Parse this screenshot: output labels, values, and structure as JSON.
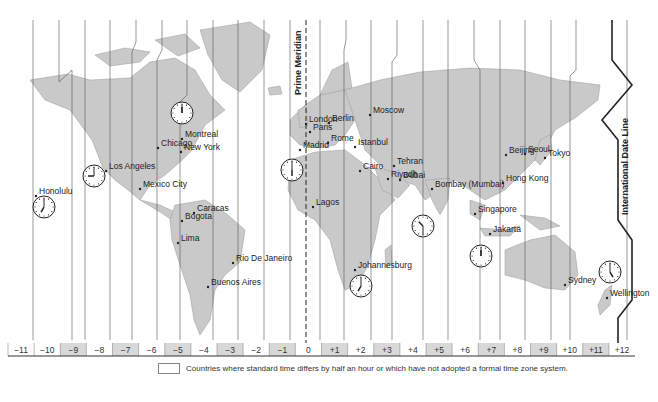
{
  "map": {
    "title": "World Time Zones",
    "prime_meridian_label": "Prime Meridian",
    "date_line_label": "International Date Line",
    "zones": [
      "−11",
      "−10",
      "−9",
      "−8",
      "−7",
      "−6",
      "−5",
      "−4",
      "−3",
      "−2",
      "−1",
      "0",
      "+1",
      "+2",
      "+3",
      "+4",
      "+5",
      "+6",
      "+7",
      "+8",
      "+9",
      "+10",
      "+11",
      "+12"
    ],
    "shaded_zones": [
      "−9",
      "−7",
      "−5",
      "−3",
      "−1",
      "+1",
      "+3",
      "+5",
      "+7",
      "+9",
      "+11"
    ],
    "cities": [
      {
        "name": "Honolulu",
        "x": 36,
        "y": 196
      },
      {
        "name": "Los Angeles",
        "x": 106,
        "y": 171
      },
      {
        "name": "Chicago",
        "x": 158,
        "y": 148
      },
      {
        "name": "Montreal",
        "x": 182,
        "y": 139
      },
      {
        "name": "New York",
        "x": 181,
        "y": 152
      },
      {
        "name": "Mexico City",
        "x": 140,
        "y": 189
      },
      {
        "name": "Caracas",
        "x": 194,
        "y": 213
      },
      {
        "name": "Bogota",
        "x": 182,
        "y": 221
      },
      {
        "name": "Lima",
        "x": 178,
        "y": 243
      },
      {
        "name": "Rio De Janeiro",
        "x": 233,
        "y": 263
      },
      {
        "name": "Buenos Aires",
        "x": 208,
        "y": 287
      },
      {
        "name": "London",
        "x": 306,
        "y": 124
      },
      {
        "name": "Paris",
        "x": 310,
        "y": 132
      },
      {
        "name": "Madrid",
        "x": 300,
        "y": 150
      },
      {
        "name": "Berlin",
        "x": 329,
        "y": 123
      },
      {
        "name": "Rome",
        "x": 328,
        "y": 143
      },
      {
        "name": "Istanbul",
        "x": 355,
        "y": 147
      },
      {
        "name": "Moscow",
        "x": 370,
        "y": 115
      },
      {
        "name": "Cairo",
        "x": 360,
        "y": 171
      },
      {
        "name": "Riyadh",
        "x": 388,
        "y": 179
      },
      {
        "name": "Tehran",
        "x": 394,
        "y": 166
      },
      {
        "name": "Dubai",
        "x": 400,
        "y": 180
      },
      {
        "name": "Bombay (Mumbai)",
        "x": 432,
        "y": 189
      },
      {
        "name": "Lagos",
        "x": 313,
        "y": 207
      },
      {
        "name": "Johannesburg",
        "x": 355,
        "y": 270
      },
      {
        "name": "Beijing",
        "x": 506,
        "y": 155
      },
      {
        "name": "Seoul",
        "x": 525,
        "y": 154
      },
      {
        "name": "Tokyo",
        "x": 545,
        "y": 158
      },
      {
        "name": "Hong Kong",
        "x": 503,
        "y": 183
      },
      {
        "name": "Singapore",
        "x": 475,
        "y": 214
      },
      {
        "name": "Jakarta",
        "x": 490,
        "y": 234
      },
      {
        "name": "Sydney",
        "x": 565,
        "y": 285
      },
      {
        "name": "Wellington",
        "x": 607,
        "y": 298
      }
    ],
    "clocks": [
      {
        "name": "Honolulu clock",
        "cx": 44,
        "cy": 207,
        "hour": 7,
        "minute": 0
      },
      {
        "name": "Los Angeles clock",
        "cx": 94,
        "cy": 176,
        "hour": 9,
        "minute": 0
      },
      {
        "name": "Montreal clock",
        "cx": 182,
        "cy": 113,
        "hour": 12,
        "minute": 0
      },
      {
        "name": "Madrid clock",
        "cx": 292,
        "cy": 170,
        "hour": 6,
        "minute": 0
      },
      {
        "name": "Bombay clock",
        "cx": 423,
        "cy": 226,
        "hour": 10,
        "minute": 30
      },
      {
        "name": "Johannesburg clock",
        "cx": 361,
        "cy": 286,
        "hour": 7,
        "minute": 0
      },
      {
        "name": "Jakarta clock",
        "cx": 481,
        "cy": 256,
        "hour": 12,
        "minute": 0
      },
      {
        "name": "Wellington clock",
        "cx": 610,
        "cy": 272,
        "hour": 5,
        "minute": 0
      }
    ]
  },
  "legend": {
    "text": "Countries where standard time differs by half an hour or which have not adopted a formal time zone system."
  },
  "colors": {
    "land": "#c9c9c9",
    "land_light": "#e2e2e2",
    "shaded_zone": "#d8d8d8",
    "line": "#555555",
    "date_line": "#222222"
  }
}
